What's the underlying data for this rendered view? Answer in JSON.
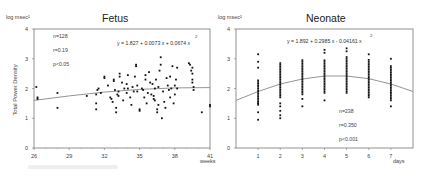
{
  "chart_data": [
    {
      "type": "scatter",
      "title": "Fetus",
      "ylabel": "Total Power Density",
      "yunit": "log msec²",
      "xlabel": "weeks",
      "xlim": [
        26,
        41
      ],
      "ylim": [
        0,
        4
      ],
      "xticks": [
        26,
        29,
        32,
        35,
        38,
        41
      ],
      "yticks": [
        0,
        1,
        2,
        3,
        4
      ],
      "grid": false,
      "stats": [
        "n=128",
        "r=0.19",
        "p<0.05"
      ],
      "equation": "y = 1.827 + 0.0073 x + 0.0674 x",
      "equation_sup": "2",
      "fit": {
        "type": "polynomial",
        "coefficients_display": [
          1.827,
          0.0073,
          0.0674
        ],
        "curve_points": [
          [
            26,
            1.6
          ],
          [
            29,
            1.75
          ],
          [
            32,
            1.88
          ],
          [
            35,
            1.97
          ],
          [
            38,
            2.02
          ],
          [
            41,
            2.03
          ]
        ]
      },
      "points": [
        [
          26.2,
          2.05
        ],
        [
          26.3,
          1.7
        ],
        [
          26.3,
          1.65
        ],
        [
          28,
          1.85
        ],
        [
          28,
          1.35
        ],
        [
          30.5,
          1.75
        ],
        [
          31.3,
          1.5
        ],
        [
          31.3,
          1.3
        ],
        [
          31.3,
          1.8
        ],
        [
          31.4,
          1.95
        ],
        [
          31.5,
          2.0
        ],
        [
          31.7,
          1.85
        ],
        [
          32,
          2.4
        ],
        [
          32,
          2.35
        ],
        [
          32.3,
          2.1
        ],
        [
          32.5,
          1.7
        ],
        [
          32.6,
          1.65
        ],
        [
          32.7,
          1.55
        ],
        [
          32.8,
          2.3
        ],
        [
          32.8,
          2.25
        ],
        [
          32.9,
          1.95
        ],
        [
          33,
          1.2
        ],
        [
          33,
          1.35
        ],
        [
          33.1,
          1.8
        ],
        [
          33.2,
          1.9
        ],
        [
          33.2,
          1.75
        ],
        [
          33.3,
          2.5
        ],
        [
          33.3,
          2.4
        ],
        [
          33.5,
          2.2
        ],
        [
          33.7,
          2.0
        ],
        [
          33.9,
          1.85
        ],
        [
          34,
          2.45
        ],
        [
          34,
          2.0
        ],
        [
          34.2,
          1.7
        ],
        [
          34.4,
          2.05
        ],
        [
          34.6,
          2.4
        ],
        [
          34.7,
          2.8
        ],
        [
          34.7,
          2.75
        ],
        [
          34.8,
          2.1
        ],
        [
          34.8,
          1.9
        ],
        [
          35,
          1.3
        ],
        [
          35,
          1.25
        ],
        [
          35.2,
          2.0
        ],
        [
          35.3,
          1.95
        ],
        [
          35.5,
          2.45
        ],
        [
          35.5,
          2.3
        ],
        [
          35.6,
          1.5
        ],
        [
          35.8,
          2.55
        ],
        [
          35.9,
          2.2
        ],
        [
          36,
          1.8
        ],
        [
          36.1,
          2.15
        ],
        [
          36.2,
          1.75
        ],
        [
          36.2,
          1.65
        ],
        [
          36.3,
          2.0
        ],
        [
          36.4,
          2.3
        ],
        [
          36.5,
          1.3
        ],
        [
          36.5,
          1.2
        ],
        [
          36.6,
          2.05
        ],
        [
          36.7,
          2.6
        ],
        [
          36.8,
          3.05
        ],
        [
          36.8,
          2.8
        ],
        [
          36.9,
          1.0
        ],
        [
          37,
          1.9
        ],
        [
          37.1,
          1.55
        ],
        [
          37.3,
          2.35
        ],
        [
          37.4,
          2.1
        ],
        [
          37.5,
          1.95
        ],
        [
          37.6,
          2.4
        ],
        [
          37.7,
          2.0
        ],
        [
          37.8,
          2.75
        ],
        [
          37.9,
          1.5
        ],
        [
          38,
          2.1
        ],
        [
          38,
          1.8
        ],
        [
          38.1,
          2.3
        ],
        [
          38.2,
          2.0
        ],
        [
          38.2,
          2.7
        ],
        [
          39.2,
          2.85
        ],
        [
          39.3,
          2.8
        ],
        [
          39.4,
          2.6
        ],
        [
          39.5,
          2.7
        ],
        [
          39.5,
          2.5
        ],
        [
          39.5,
          2.3
        ],
        [
          39.5,
          2.2
        ],
        [
          39.6,
          2.05
        ],
        [
          39.6,
          1.95
        ],
        [
          40.3,
          1.2
        ],
        [
          33.6,
          1.6
        ],
        [
          34.3,
          1.45
        ],
        [
          35.4,
          1.7
        ],
        [
          36.6,
          1.45
        ],
        [
          37.2,
          1.35
        ],
        [
          33.9,
          2.15
        ],
        [
          34.5,
          1.9
        ],
        [
          35.7,
          1.85
        ],
        [
          36.3,
          1.6
        ],
        [
          37.6,
          1.7
        ]
      ],
      "edge_points": [
        [
          41,
          1.45
        ],
        [
          41,
          1.4
        ]
      ]
    },
    {
      "type": "scatter",
      "title": "Neonate",
      "yunit": "log msec²",
      "xlabel": "days",
      "xlim": [
        0,
        8
      ],
      "ylim": [
        0,
        4
      ],
      "xticks": [
        1,
        2,
        3,
        4,
        5,
        6,
        7
      ],
      "yticks": [
        0,
        1,
        2,
        3,
        4
      ],
      "grid": false,
      "stats": [
        "n=238",
        "r=0.350",
        "p<0.001"
      ],
      "equation": "y = 1.892 + 0.2985 x - 0.04161 x",
      "equation_sup": "2",
      "fit": {
        "type": "polynomial",
        "coefficients_display": [
          1.892,
          0.2985,
          -0.04161
        ],
        "curve_points": [
          [
            0,
            1.6
          ],
          [
            1,
            1.9
          ],
          [
            2,
            2.15
          ],
          [
            3,
            2.32
          ],
          [
            4,
            2.42
          ],
          [
            5,
            2.42
          ],
          [
            6,
            2.33
          ],
          [
            7,
            2.15
          ],
          [
            8,
            1.9
          ]
        ]
      },
      "columns": [
        {
          "x": 1,
          "min": 0.95,
          "max": 3.15,
          "dense_min": 1.45,
          "dense_max": 2.3,
          "outliers": [
            0.95,
            1.2,
            1.5,
            2.7,
            2.9,
            3.15
          ]
        },
        {
          "x": 2,
          "min": 1.0,
          "max": 2.9,
          "dense_min": 1.7,
          "dense_max": 2.9,
          "outliers": [
            1.0,
            1.1,
            1.25,
            1.4,
            1.5
          ]
        },
        {
          "x": 3,
          "min": 1.4,
          "max": 3.0,
          "dense_min": 1.8,
          "dense_max": 3.0,
          "outliers": [
            1.4,
            1.65
          ]
        },
        {
          "x": 4,
          "min": 1.6,
          "max": 3.3,
          "dense_min": 1.85,
          "dense_max": 3.0,
          "outliers": [
            1.6,
            3.2,
            3.3
          ]
        },
        {
          "x": 5,
          "min": 1.85,
          "max": 3.35,
          "dense_min": 1.85,
          "dense_max": 3.1,
          "outliers": [
            3.25,
            3.35
          ]
        },
        {
          "x": 6,
          "min": 1.7,
          "max": 3.15,
          "dense_min": 1.7,
          "dense_max": 3.0,
          "outliers": [
            3.15
          ]
        },
        {
          "x": 7,
          "min": 1.4,
          "max": 3.0,
          "dense_min": 1.6,
          "dense_max": 2.8,
          "outliers": [
            1.4,
            3.0
          ]
        }
      ]
    }
  ]
}
